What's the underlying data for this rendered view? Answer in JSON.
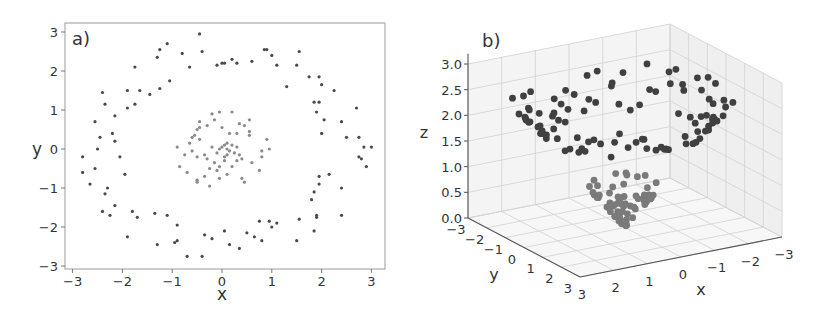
{
  "chart_data": [
    {
      "type": "scatter",
      "panel_label": "a)",
      "xlabel": "x",
      "ylabel": "y",
      "xlim": [
        -3.1,
        3.1
      ],
      "ylim": [
        -3.1,
        3.1
      ],
      "xticks": [
        "−3",
        "−2",
        "−1",
        "0",
        "1",
        "2",
        "3"
      ],
      "yticks": [
        "3",
        "2",
        "1",
        "0",
        "−1",
        "−2",
        "−3"
      ],
      "grid": false,
      "series": [
        {
          "name": "outer ring",
          "color": "#4a4a4a",
          "points": [
            [
              -0.45,
              2.95
            ],
            [
              -1.1,
              2.7
            ],
            [
              -1.25,
              2.55
            ],
            [
              -1.3,
              2.35
            ],
            [
              -0.8,
              2.45
            ],
            [
              -0.4,
              2.5
            ],
            [
              -0.65,
              2.1
            ],
            [
              -1.75,
              2.1
            ],
            [
              -0.1,
              2.15
            ],
            [
              0.0,
              2.2
            ],
            [
              0.05,
              2.2
            ],
            [
              0.2,
              2.3
            ],
            [
              0.3,
              2.2
            ],
            [
              0.6,
              2.25
            ],
            [
              0.85,
              2.55
            ],
            [
              0.9,
              2.55
            ],
            [
              1.0,
              2.4
            ],
            [
              1.1,
              2.15
            ],
            [
              1.55,
              2.5
            ],
            [
              1.5,
              2.15
            ],
            [
              1.3,
              1.6
            ],
            [
              1.75,
              1.85
            ],
            [
              1.95,
              1.85
            ],
            [
              2.0,
              1.65
            ],
            [
              2.25,
              1.5
            ],
            [
              -1.05,
              1.75
            ],
            [
              -1.25,
              1.55
            ],
            [
              -1.45,
              1.4
            ],
            [
              -1.65,
              1.5
            ],
            [
              -1.9,
              1.5
            ],
            [
              -2.4,
              1.45
            ],
            [
              -2.35,
              1.15
            ],
            [
              -1.75,
              1.15
            ],
            [
              -1.9,
              1.05
            ],
            [
              -2.15,
              0.85
            ],
            [
              -2.55,
              0.7
            ],
            [
              -2.2,
              0.4
            ],
            [
              -2.45,
              0.3
            ],
            [
              -2.15,
              0.2
            ],
            [
              -2.5,
              0.0
            ],
            [
              -2.05,
              -0.2
            ],
            [
              -2.8,
              -0.2
            ],
            [
              -2.55,
              -0.5
            ],
            [
              -1.95,
              -0.65
            ],
            [
              -2.8,
              -0.6
            ],
            [
              -2.65,
              -0.9
            ],
            [
              -2.3,
              -1.0
            ],
            [
              -2.35,
              -1.15
            ],
            [
              -2.15,
              -1.45
            ],
            [
              -2.4,
              -1.6
            ],
            [
              -2.25,
              -1.7
            ],
            [
              -1.8,
              -1.6
            ],
            [
              -1.7,
              -1.75
            ],
            [
              -1.9,
              -2.25
            ],
            [
              -1.35,
              -1.65
            ],
            [
              -1.1,
              -1.7
            ],
            [
              -0.9,
              -1.95
            ],
            [
              -1.3,
              -2.45
            ],
            [
              -0.95,
              -2.4
            ],
            [
              -0.9,
              -2.35
            ],
            [
              -0.7,
              -2.75
            ],
            [
              -0.4,
              -2.75
            ],
            [
              -0.35,
              -2.2
            ],
            [
              -0.2,
              -2.3
            ],
            [
              0.05,
              -2.1
            ],
            [
              0.15,
              -2.45
            ],
            [
              0.35,
              -2.55
            ],
            [
              0.5,
              -2.15
            ],
            [
              0.65,
              -2.25
            ],
            [
              0.75,
              -1.85
            ],
            [
              0.8,
              -2.35
            ],
            [
              0.95,
              -1.85
            ],
            [
              1.0,
              -2.0
            ],
            [
              1.1,
              -1.9
            ],
            [
              1.5,
              -2.35
            ],
            [
              1.55,
              -1.8
            ],
            [
              1.85,
              -2.1
            ],
            [
              1.8,
              -1.3
            ],
            [
              1.85,
              -1.1
            ],
            [
              1.9,
              -1.7
            ],
            [
              1.9,
              -1.75
            ],
            [
              1.95,
              -0.7
            ],
            [
              1.95,
              -0.9
            ],
            [
              2.15,
              -0.65
            ],
            [
              2.4,
              -1.0
            ],
            [
              2.4,
              -1.7
            ],
            [
              2.0,
              0.4
            ],
            [
              2.05,
              0.75
            ],
            [
              1.85,
              1.2
            ],
            [
              1.95,
              1.2
            ],
            [
              1.9,
              0.95
            ],
            [
              2.4,
              0.7
            ],
            [
              2.5,
              0.3
            ],
            [
              2.7,
              1.05
            ],
            [
              2.75,
              0.3
            ],
            [
              2.75,
              -0.2
            ],
            [
              2.8,
              -0.25
            ],
            [
              2.85,
              0.05
            ],
            [
              2.9,
              -0.45
            ],
            [
              3.0,
              0.05
            ]
          ]
        },
        {
          "name": "inner cluster",
          "color": "#8a8a8a",
          "points": [
            [
              -0.05,
              0.95
            ],
            [
              0.2,
              0.95
            ],
            [
              0.0,
              0.55
            ],
            [
              -0.2,
              0.9
            ],
            [
              -0.15,
              0.75
            ],
            [
              0.35,
              0.65
            ],
            [
              0.45,
              0.6
            ],
            [
              0.55,
              0.75
            ],
            [
              0.55,
              0.45
            ],
            [
              0.55,
              0.35
            ],
            [
              -0.45,
              0.7
            ],
            [
              -0.5,
              0.5
            ],
            [
              -0.45,
              0.55
            ],
            [
              -0.3,
              0.6
            ],
            [
              -0.55,
              0.35
            ],
            [
              -0.6,
              0.3
            ],
            [
              -0.65,
              0.15
            ],
            [
              -0.45,
              0.25
            ],
            [
              -0.9,
              0.05
            ],
            [
              -0.75,
              -0.15
            ],
            [
              -0.6,
              -0.05
            ],
            [
              -0.5,
              -0.2
            ],
            [
              -0.35,
              -0.15
            ],
            [
              -0.3,
              -0.25
            ],
            [
              -0.2,
              0.05
            ],
            [
              -0.1,
              -0.1
            ],
            [
              0.0,
              0.05
            ],
            [
              0.05,
              0.1
            ],
            [
              0.1,
              0.0
            ],
            [
              0.1,
              -0.15
            ],
            [
              0.15,
              -0.05
            ],
            [
              0.2,
              0.1
            ],
            [
              0.25,
              -0.1
            ],
            [
              0.3,
              0.05
            ],
            [
              0.35,
              -0.15
            ],
            [
              0.4,
              -0.25
            ],
            [
              0.3,
              -0.3
            ],
            [
              0.2,
              -0.45
            ],
            [
              0.05,
              -0.3
            ],
            [
              -0.05,
              -0.45
            ],
            [
              -0.1,
              -0.55
            ],
            [
              -0.25,
              -0.5
            ],
            [
              -0.35,
              -0.7
            ],
            [
              -0.5,
              -0.8
            ],
            [
              -0.5,
              -0.85
            ],
            [
              -0.25,
              -0.95
            ],
            [
              -0.05,
              -0.75
            ],
            [
              0.1,
              -0.65
            ],
            [
              0.4,
              -0.75
            ],
            [
              0.45,
              -0.85
            ],
            [
              0.6,
              -0.35
            ],
            [
              0.75,
              -0.55
            ],
            [
              0.8,
              -0.2
            ],
            [
              0.8,
              -0.05
            ],
            [
              0.9,
              0.25
            ],
            [
              0.95,
              0.0
            ],
            [
              -0.85,
              -0.45
            ],
            [
              -0.7,
              -0.6
            ],
            [
              -0.15,
              -0.35
            ],
            [
              0.15,
              0.4
            ],
            [
              0.3,
              0.4
            ],
            [
              0.05,
              -0.2
            ],
            [
              -0.05,
              0.0
            ],
            [
              0.1,
              0.15
            ]
          ]
        }
      ]
    },
    {
      "type": "scatter",
      "subtype": "3d",
      "panel_label": "b)",
      "xlabel": "x",
      "ylabel": "y",
      "zlabel": "z",
      "xlim": [
        -3,
        3
      ],
      "ylim": [
        -3,
        3
      ],
      "zlim": [
        0.0,
        3.0
      ],
      "xticks": [
        "3",
        "2",
        "1",
        "0",
        "−1",
        "−2",
        "−3"
      ],
      "yticks": [
        "−3",
        "−2",
        "−1",
        "0",
        "1",
        "2",
        "3"
      ],
      "zticks": [
        "3.0",
        "2.5",
        "2.0",
        "1.5",
        "1.0",
        "0.5",
        "0.0"
      ],
      "grid": true,
      "series": [
        {
          "name": "outer ring (z ≈ 1.7–3.0)",
          "color": "#404040"
        },
        {
          "name": "inner cluster (z ≈ 0.0–1.0)",
          "color": "#7a7a7a"
        }
      ]
    }
  ]
}
